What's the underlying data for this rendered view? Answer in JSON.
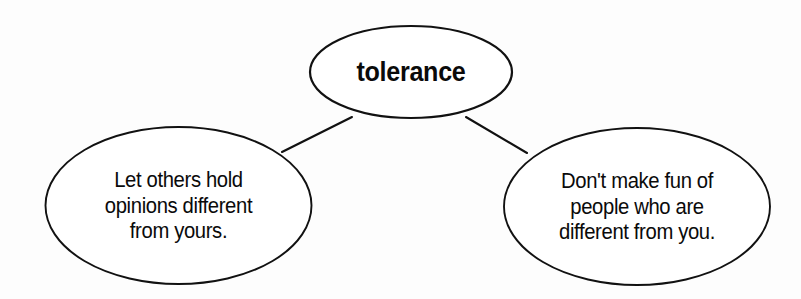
{
  "diagram": {
    "type": "concept-web",
    "title": "tolerance",
    "background_color": "#fdfdfd",
    "stroke_color": "#111111",
    "text_color": "#0a0a0a",
    "center": {
      "id": "center-node",
      "label": "tolerance",
      "shape": "ellipse",
      "cx": 411,
      "cy": 72,
      "rx": 101,
      "ry": 46
    },
    "branches": [
      {
        "id": "left-node",
        "shape": "ellipse",
        "cx": 178,
        "cy": 205,
        "rx": 133,
        "ry": 78,
        "lines": [
          "Let others hold",
          "opinions different",
          "from yours."
        ],
        "text": "Let others hold opinions different from yours."
      },
      {
        "id": "right-node",
        "shape": "ellipse",
        "cx": 637,
        "cy": 206,
        "rx": 133,
        "ry": 78,
        "lines": [
          "Don't make fun of",
          "people who are",
          "different from you."
        ],
        "text": "Don't make fun of people who are different from you."
      }
    ],
    "connectors": [
      {
        "id": "connector-left",
        "from": "center-node",
        "to": "left-node",
        "x1": 352,
        "y1": 117,
        "x2": 282,
        "y2": 152
      },
      {
        "id": "connector-right",
        "from": "center-node",
        "to": "right-node",
        "x1": 466,
        "y1": 117,
        "x2": 527,
        "y2": 153
      }
    ]
  }
}
